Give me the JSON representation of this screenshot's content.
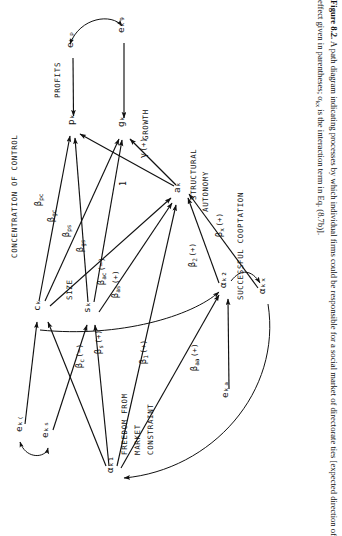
{
  "figure": {
    "number": "Figure 8.2.",
    "caption_part1": "A path diagram indicating processes by which individual firms could be responsible for a social market of directorate ties [expected direction of effect given in parentheses; α",
    "caption_sub": "kx",
    "caption_part2": " is the interaction term in Eq. (8.7b)]."
  },
  "nodes": [
    {
      "id": "e_kp",
      "label": "eₖₚ",
      "x": 73,
      "y": 48
    },
    {
      "id": "e_kg",
      "label": "eₖ₉",
      "x": 124,
      "y": 33
    },
    {
      "id": "p_k",
      "label": "pₖ",
      "x": 74,
      "y": 125
    },
    {
      "id": "g_k",
      "label": "gₖ",
      "x": 124,
      "y": 127
    },
    {
      "id": "a_k",
      "label": "aₖ",
      "x": 180,
      "y": 193
    },
    {
      "id": "c_k",
      "label": "cₖ",
      "x": 40,
      "y": 311
    },
    {
      "id": "s_k",
      "label": "sₖ",
      "x": 90,
      "y": 313
    },
    {
      "id": "alpha_k2",
      "label": "αₖ₂",
      "x": 226,
      "y": 288
    },
    {
      "id": "alpha_kx",
      "label": "αₖₓ",
      "x": 265,
      "y": 294
    },
    {
      "id": "e_kc",
      "label": "eₖ₍",
      "x": 22,
      "y": 432
    },
    {
      "id": "e_ks",
      "label": "eₖₛ",
      "x": 48,
      "y": 438
    },
    {
      "id": "alpha_k1",
      "label": "αₖ₁",
      "x": 113,
      "y": 473
    },
    {
      "id": "e_ka",
      "label": "eₖₐ",
      "x": 228,
      "y": 398
    }
  ],
  "node_names": [
    {
      "id": "profits",
      "text": "PROFITS",
      "x": 60,
      "y": 98
    },
    {
      "id": "growth",
      "text": "GROWTH",
      "x": 148,
      "y": 140
    },
    {
      "id": "structural",
      "text": "STRUCTURAL",
      "x": 196,
      "y": 200
    },
    {
      "id": "autonomy",
      "text": "AUTONOMY",
      "x": 208,
      "y": 212
    },
    {
      "id": "concentration",
      "text": "CONCENTRATION OF CONTROL",
      "x": 17,
      "y": 258
    },
    {
      "id": "size",
      "text": "SIZE",
      "x": 72,
      "y": 300
    },
    {
      "id": "cooptation",
      "text": "SUCCESSFUL COOPTATION",
      "x": 243,
      "y": 300
    },
    {
      "id": "freedom1",
      "text": "FREEDOM FROM",
      "x": 127,
      "y": 455
    },
    {
      "id": "freedom2",
      "text": "MARKET",
      "x": 140,
      "y": 455
    },
    {
      "id": "freedom3",
      "text": "CONSTRAINT",
      "x": 153,
      "y": 455
    }
  ],
  "path_labels": [
    {
      "id": "beta_pc",
      "text": "β",
      "sub": "pc",
      "paren": "",
      "x": 41,
      "y": 206
    },
    {
      "id": "beta_gc",
      "text": "β",
      "sub": "gc",
      "paren": "",
      "x": 54,
      "y": 222
    },
    {
      "id": "beta_ps",
      "text": "β",
      "sub": "ps",
      "paren": "",
      "x": 69,
      "y": 237
    },
    {
      "id": "beta_gs",
      "text": "β",
      "sub": "gs",
      "paren": "",
      "x": 83,
      "y": 252
    },
    {
      "id": "beta_ac",
      "text": "β",
      "sub": "ac",
      "paren": "(−)",
      "x": 104,
      "y": 285
    },
    {
      "id": "beta_as",
      "text": "β",
      "sub": "as",
      "paren": "(+)",
      "x": 118,
      "y": 298
    },
    {
      "id": "gamma",
      "text": "γ",
      "sub": "",
      "paren": "(+)",
      "x": 146,
      "y": 158
    },
    {
      "id": "one",
      "text": "1",
      "sub": "",
      "paren": "",
      "x": 126,
      "y": 186
    },
    {
      "id": "beta_x",
      "text": "β",
      "sub": "x",
      "paren": "(+)",
      "x": 222,
      "y": 237
    },
    {
      "id": "beta_2",
      "text": "β",
      "sub": "2",
      "paren": "(+)",
      "x": 195,
      "y": 267
    },
    {
      "id": "beta_c",
      "text": "β",
      "sub": "c",
      "paren": "(−)",
      "x": 82,
      "y": 368
    },
    {
      "id": "beta_s",
      "text": "β",
      "sub": "s",
      "paren": "(+)",
      "x": 101,
      "y": 354
    },
    {
      "id": "beta_1",
      "text": "β",
      "sub": "1",
      "paren": "(+)",
      "x": 146,
      "y": 364
    },
    {
      "id": "beta_aa",
      "text": "β",
      "sub": "aa",
      "paren": "(+)",
      "x": 197,
      "y": 371
    }
  ],
  "colors": {
    "ink": "#111111",
    "background": "#ffffff"
  }
}
